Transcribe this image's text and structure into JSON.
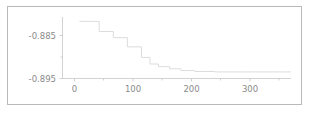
{
  "figure": {
    "background_color": "#ffffff",
    "border_color": "#b9b9b9",
    "axis_color": "#c6c6c6",
    "line_color": "#dcdcdc",
    "label_color": "#8a8a8a"
  },
  "chart_data": {
    "type": "line",
    "title": "",
    "subtitle": "",
    "xlabel": "",
    "ylabel": "",
    "legend": [],
    "legend_position": "none",
    "grid": false,
    "drawstyle": "steps-post",
    "xlim": [
      -20,
      385
    ],
    "ylim": [
      -0.8965,
      -0.8825
    ],
    "xticks": [
      0,
      100,
      200,
      300
    ],
    "xtick_labels": [
      "0",
      "100",
      "200",
      "300"
    ],
    "xticks_minor": [
      50,
      150,
      250,
      350
    ],
    "yticks": [
      -0.885,
      -0.895
    ],
    "ytick_labels": [
      "-0.885",
      "-0.895"
    ],
    "yticks_minor": [
      -0.89
    ],
    "x": [
      10,
      25,
      45,
      70,
      95,
      120,
      135,
      150,
      170,
      190,
      215,
      250,
      300,
      375
    ],
    "y": [
      -0.8835,
      -0.8835,
      -0.8858,
      -0.8872,
      -0.8893,
      -0.8917,
      -0.8932,
      -0.8938,
      -0.8943,
      -0.8947,
      -0.8949,
      -0.895,
      -0.895,
      -0.895
    ],
    "series": [
      {
        "name": "objective",
        "x": [
          10,
          25,
          45,
          70,
          95,
          120,
          135,
          150,
          170,
          190,
          215,
          250,
          300,
          375
        ],
        "values": [
          -0.8835,
          -0.8835,
          -0.8858,
          -0.8872,
          -0.8893,
          -0.8917,
          -0.8932,
          -0.8938,
          -0.8943,
          -0.8947,
          -0.8949,
          -0.895,
          -0.895,
          -0.895
        ]
      }
    ]
  }
}
